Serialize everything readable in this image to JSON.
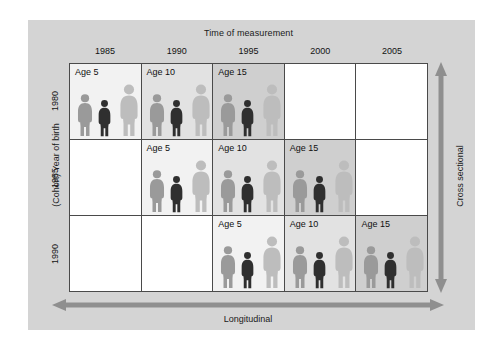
{
  "figure": {
    "top_title": "Time of measurement",
    "left_axis_title": "(Cohort) Year of birth",
    "right_axis_title": "Cross sectional",
    "bottom_axis_title": "Longitudinal",
    "column_headers": [
      "1985",
      "1990",
      "1995",
      "2000",
      "2005"
    ],
    "row_headers": [
      "1980",
      "1985",
      "1990"
    ]
  },
  "colors": {
    "panel_background": "#d4d4d4",
    "page_background": "#ffffff",
    "grid_line": "#4a4a4a",
    "cell_empty": "#ffffff",
    "cell_shade_light": "#f2f2f2",
    "cell_shade_medium": "#e2e2e2",
    "cell_shade_dark": "#cfcfcf",
    "person_light": "#bdbdbd",
    "person_medium": "#9a9a9a",
    "person_dark": "#2f2f2f",
    "arrow": "#8f8f8f",
    "text": "#121212"
  },
  "chart_data": {
    "type": "table",
    "xlabel": "Time of measurement",
    "ylabel": "(Cohort) Year of birth",
    "x": [
      "1985",
      "1990",
      "1995",
      "2000",
      "2005"
    ],
    "y": [
      "1980",
      "1985",
      "1990"
    ],
    "annotations": [
      "Longitudinal",
      "Cross sectional"
    ],
    "cells": [
      [
        {
          "row": "1980",
          "col": "1985",
          "label": "Age 5",
          "age": 5,
          "shade": 1,
          "filled": true
        },
        {
          "row": "1980",
          "col": "1990",
          "label": "Age 10",
          "age": 10,
          "shade": 2,
          "filled": true
        },
        {
          "row": "1980",
          "col": "1995",
          "label": "Age 15",
          "age": 15,
          "shade": 3,
          "filled": true
        },
        {
          "row": "1980",
          "col": "2000",
          "label": "",
          "age": null,
          "shade": 0,
          "filled": false
        },
        {
          "row": "1980",
          "col": "2005",
          "label": "",
          "age": null,
          "shade": 0,
          "filled": false
        }
      ],
      [
        {
          "row": "1985",
          "col": "1985",
          "label": "",
          "age": null,
          "shade": 0,
          "filled": false
        },
        {
          "row": "1985",
          "col": "1990",
          "label": "Age 5",
          "age": 5,
          "shade": 1,
          "filled": true
        },
        {
          "row": "1985",
          "col": "1995",
          "label": "Age 10",
          "age": 10,
          "shade": 2,
          "filled": true
        },
        {
          "row": "1985",
          "col": "2000",
          "label": "Age 15",
          "age": 15,
          "shade": 3,
          "filled": true
        },
        {
          "row": "1985",
          "col": "2005",
          "label": "",
          "age": null,
          "shade": 0,
          "filled": false
        }
      ],
      [
        {
          "row": "1990",
          "col": "1985",
          "label": "",
          "age": null,
          "shade": 0,
          "filled": false
        },
        {
          "row": "1990",
          "col": "1990",
          "label": "",
          "age": null,
          "shade": 0,
          "filled": false
        },
        {
          "row": "1990",
          "col": "1995",
          "label": "Age 5",
          "age": 5,
          "shade": 1,
          "filled": true
        },
        {
          "row": "1990",
          "col": "2000",
          "label": "Age 10",
          "age": 10,
          "shade": 2,
          "filled": true
        },
        {
          "row": "1990",
          "col": "2005",
          "label": "Age 15",
          "age": 15,
          "shade": 3,
          "filled": true
        }
      ]
    ],
    "figure_group": {
      "description": "Each filled cell shows three human silhouettes",
      "people": [
        {
          "slot": "left",
          "tone": "medium",
          "height_px": 44
        },
        {
          "slot": "center",
          "tone": "dark",
          "height_px": 38
        },
        {
          "slot": "right",
          "tone": "light",
          "height_px": 54
        }
      ]
    }
  }
}
